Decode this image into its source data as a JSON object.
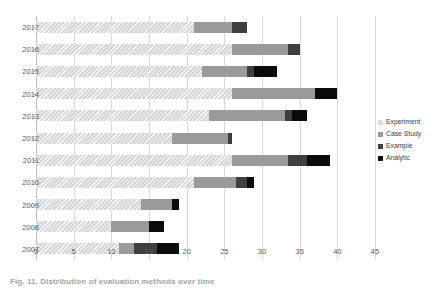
{
  "caption": "Fig. 11. Distribution of evaluation methods over time",
  "legend": {
    "position": "right",
    "items": [
      {
        "label": "Experiment",
        "color": "#d6d6d6",
        "key": "experiment"
      },
      {
        "label": "Case Study",
        "color": "#9a9a9a",
        "key": "casestudy"
      },
      {
        "label": "Example",
        "color": "#3f3f3f",
        "key": "example"
      },
      {
        "label": "Analytic",
        "color": "#0b0b0b",
        "key": "analytic"
      }
    ]
  },
  "chart_data": {
    "type": "bar",
    "orientation": "horizontal",
    "stacked": true,
    "title": "",
    "xlabel": "",
    "ylabel": "",
    "xlim": [
      0,
      45
    ],
    "xticks": [
      0,
      5,
      10,
      15,
      20,
      25,
      30,
      35,
      40,
      45
    ],
    "xtick_labels": [
      "0",
      "5",
      "10",
      "15",
      "20",
      "25",
      "30",
      "35",
      "40",
      "45"
    ],
    "grid": true,
    "grid_axis": "x",
    "categories": [
      "2017",
      "2016",
      "2015",
      "2014",
      "2013",
      "2012",
      "2011",
      "2010",
      "2009",
      "2008",
      "2007"
    ],
    "series": [
      {
        "name": "Experiment",
        "color": "#d6d6d6",
        "values": [
          21,
          26,
          22,
          26,
          23,
          18,
          26,
          21,
          14,
          10,
          11
        ]
      },
      {
        "name": "Case Study",
        "color": "#9a9a9a",
        "values": [
          5,
          7.5,
          6,
          11,
          10,
          7.5,
          7.5,
          5.5,
          4,
          5,
          2
        ]
      },
      {
        "name": "Example",
        "color": "#3f3f3f",
        "values": [
          2,
          1.5,
          1,
          0,
          1,
          0.5,
          2.5,
          1.5,
          0,
          0,
          3
        ]
      },
      {
        "name": "Analytic",
        "color": "#0b0b0b",
        "values": [
          0,
          0,
          3,
          3,
          2,
          0,
          3,
          1,
          1,
          2,
          3
        ]
      }
    ],
    "totals": [
      28,
      35,
      32,
      40,
      36,
      26,
      39,
      29,
      19,
      17,
      19
    ]
  }
}
